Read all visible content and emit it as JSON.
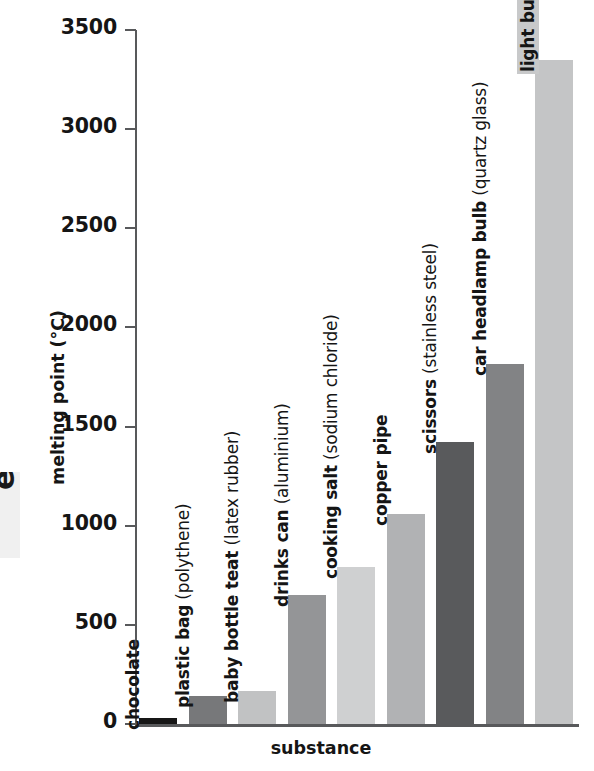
{
  "margin_fragment": {
    "text": "e"
  },
  "chart_data": {
    "type": "bar",
    "title": "",
    "xlabel": "substance",
    "ylabel": "melting point (°C)",
    "ylim": [
      0,
      3500
    ],
    "ytick_step": 500,
    "yticks": [
      0,
      500,
      1000,
      1500,
      2000,
      2500,
      3000,
      3500
    ],
    "ytick_labels": [
      "0",
      "500",
      "1000",
      "1500",
      "2000",
      "2500",
      "3000",
      "3500"
    ],
    "grid": false,
    "legend": "none",
    "categories": [
      "chocolate",
      "plastic bag (polythene)",
      "baby bottle teat (latex rubber)",
      "drinks can (aluminium)",
      "cooking salt (sodium chloride)",
      "copper pipe",
      "scissors (stainless steel)",
      "car headlamp bulb (quartz glass)",
      "light bulb filament (tungsten)"
    ],
    "values": [
      30,
      140,
      165,
      650,
      790,
      1060,
      1420,
      1815,
      3350
    ],
    "bars": [
      {
        "name_main": "chocolate",
        "name_paren": "",
        "value": 30,
        "color": "#161616",
        "highlight": false
      },
      {
        "name_main": "plastic bag",
        "name_paren": " (polythene)",
        "value": 140,
        "color": "#77787a",
        "highlight": false
      },
      {
        "name_main": "baby bottle teat",
        "name_paren": " (latex rubber)",
        "value": 165,
        "color": "#c1c2c3",
        "highlight": false
      },
      {
        "name_main": "drinks can",
        "name_paren": " (aluminium)",
        "value": 650,
        "color": "#949597",
        "highlight": false
      },
      {
        "name_main": "cooking salt",
        "name_paren": " (sodium chloride)",
        "value": 790,
        "color": "#cfd0d1",
        "highlight": false
      },
      {
        "name_main": "copper pipe",
        "name_paren": "",
        "value": 1060,
        "color": "#b1b2b4",
        "highlight": false
      },
      {
        "name_main": "scissors",
        "name_paren": " (stainless steel)",
        "value": 1420,
        "color": "#595a5c",
        "highlight": false
      },
      {
        "name_main": "car headlamp bulb",
        "name_paren": " (quartz glass)",
        "value": 1815,
        "color": "#828385",
        "highlight": false
      },
      {
        "name_main": "light bulb filament",
        "name_paren": " (tungsten)",
        "value": 3350,
        "color": "#c4c5c6",
        "highlight": true
      }
    ]
  }
}
